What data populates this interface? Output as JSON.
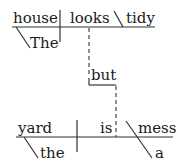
{
  "diagram": {
    "type": "reed-kellogg-sentence-diagram",
    "sentence": "The house looks tidy but the yard is a mess",
    "clause1": {
      "subject": "house",
      "verb": "looks",
      "complement": "tidy",
      "modifier": "The"
    },
    "conjunction": "but",
    "clause2": {
      "subject": "yard",
      "verb": "is",
      "complement": "mess",
      "subject_modifier": "the",
      "complement_modifier": "a"
    },
    "colors": {
      "line": "#333333",
      "text": "#1a1a1a",
      "background": "#ffffff"
    }
  }
}
